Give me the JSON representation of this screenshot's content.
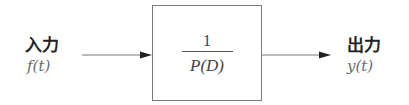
{
  "input": {
    "label": "入力",
    "signal": "f(t)"
  },
  "block": {
    "numerator": "1",
    "denominator": "P(D)"
  },
  "output": {
    "label": "出力",
    "signal": "y(t)"
  },
  "colors": {
    "line": "#7a7a7a",
    "arrowhead": "#222222",
    "label_text": "#222222",
    "math_text": "#6a6a6a"
  }
}
